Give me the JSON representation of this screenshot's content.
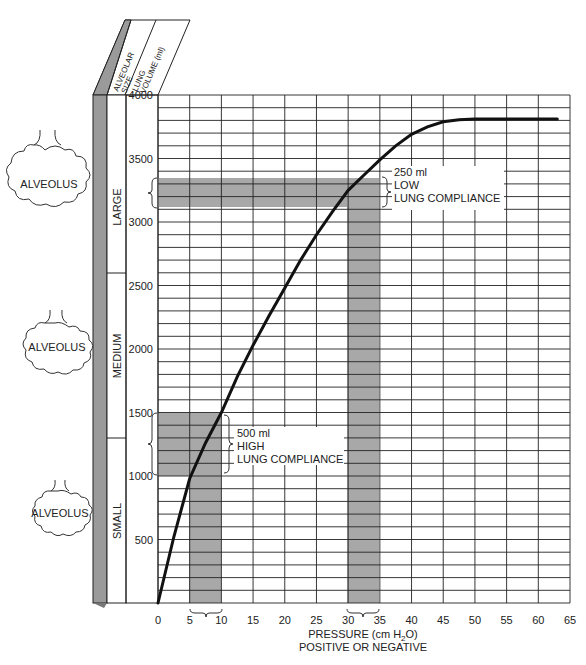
{
  "header": {
    "col1": "ALVEOLAR SIZE",
    "col1_line1": "ALVEOLAR",
    "col1_line2": "SIZE",
    "col2_line1": "LUNG",
    "col2_line2": "VOLUME (ml)"
  },
  "alveoli": [
    {
      "label": "ALVEOLUS",
      "size": "large"
    },
    {
      "label": "ALVEOLUS",
      "size": "medium"
    },
    {
      "label": "ALVEOLUS",
      "size": "small"
    }
  ],
  "size_bands": [
    {
      "label": "LARGE",
      "from": 2600,
      "to": 4000
    },
    {
      "label": "MEDIUM",
      "from": 1300,
      "to": 2600
    },
    {
      "label": "SMALL",
      "from": 0,
      "to": 1300
    }
  ],
  "annotations": {
    "low": {
      "line1": "250 ml",
      "line2": "LOW",
      "line3": "LUNG COMPLIANCE"
    },
    "high": {
      "line1": "500 ml",
      "line2": "HIGH",
      "line3": "LUNG COMPLIANCE"
    }
  },
  "axis": {
    "xlabel_line1": "PRESSURE (cm H",
    "xlabel_sub": "2",
    "xlabel_end": "O)",
    "xlabel_line2": "POSITIVE OR NEGATIVE"
  },
  "colors": {
    "shade": "#a8a8a8",
    "grid": "#222222",
    "curve": "#111111",
    "pillar": "#9a9a9a"
  },
  "chart_data": {
    "type": "line",
    "title": "",
    "xlabel": "PRESSURE (cm H2O) POSITIVE OR NEGATIVE",
    "ylabel": "LUNG VOLUME (ml)",
    "xlim": [
      0,
      65
    ],
    "ylim": [
      0,
      4000
    ],
    "x_ticks": [
      0,
      5,
      10,
      15,
      20,
      25,
      30,
      35,
      40,
      45,
      50,
      55,
      60,
      65
    ],
    "y_ticks": [
      500,
      1000,
      1500,
      2000,
      2500,
      3000,
      3500,
      4000
    ],
    "grid": true,
    "series": [
      {
        "name": "Lung compliance curve",
        "x": [
          0,
          2.5,
          5,
          7.5,
          10,
          12.5,
          15,
          17.5,
          20,
          22.5,
          25,
          27.5,
          30,
          32.5,
          35,
          37.5,
          40,
          42.5,
          45,
          47.5,
          50,
          55,
          60,
          63
        ],
        "y": [
          0,
          520,
          980,
          1260,
          1500,
          1780,
          2030,
          2260,
          2480,
          2700,
          2900,
          3080,
          3250,
          3370,
          3490,
          3600,
          3690,
          3750,
          3790,
          3805,
          3810,
          3810,
          3810,
          3810
        ]
      }
    ],
    "highlights": [
      {
        "label": "500 ml HIGH LUNG COMPLIANCE",
        "x_range": [
          5,
          10
        ],
        "y_range": [
          1000,
          1500
        ]
      },
      {
        "label": "250 ml LOW LUNG COMPLIANCE",
        "x_range": [
          30,
          35
        ],
        "y_range": [
          3250,
          3500
        ]
      }
    ]
  }
}
